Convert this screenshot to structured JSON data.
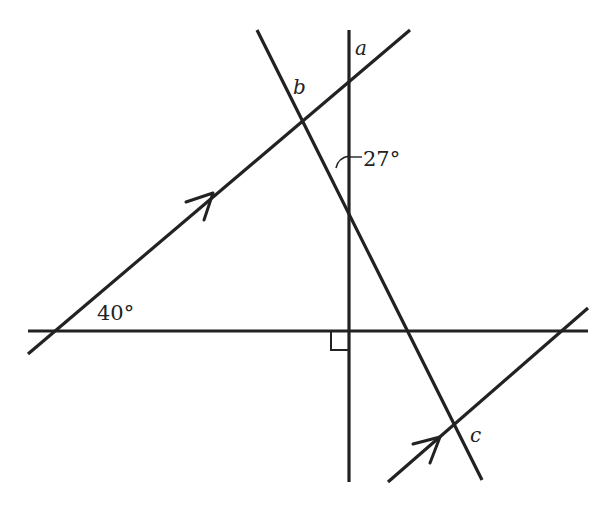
{
  "diagram": {
    "type": "geometry-angles",
    "colors": {
      "line": "#222222",
      "background": "#ffffff"
    },
    "labels": {
      "angle_a": "a",
      "angle_b": "b",
      "angle_c": "c",
      "angle_27": "27°",
      "angle_40": "40°"
    },
    "lines": [
      {
        "name": "vertical-line",
        "from": [
          349,
          30
        ],
        "to": [
          349,
          482
        ]
      },
      {
        "name": "horizontal-line",
        "from": [
          28,
          331
        ],
        "to": [
          588,
          331
        ]
      },
      {
        "name": "upper-parallel-line",
        "from": [
          28,
          354
        ],
        "to": [
          410,
          30
        ],
        "arrow": "single"
      },
      {
        "name": "transversal-line",
        "from": [
          257,
          30
        ],
        "to": [
          482,
          480
        ]
      },
      {
        "name": "lower-parallel-line",
        "from": [
          388,
          482
        ],
        "to": [
          588,
          308
        ],
        "arrow": "single"
      }
    ],
    "markers": {
      "right_angle": "right-angle-square",
      "parallel_arrows": "single-arrow-on-each-parallel"
    }
  }
}
